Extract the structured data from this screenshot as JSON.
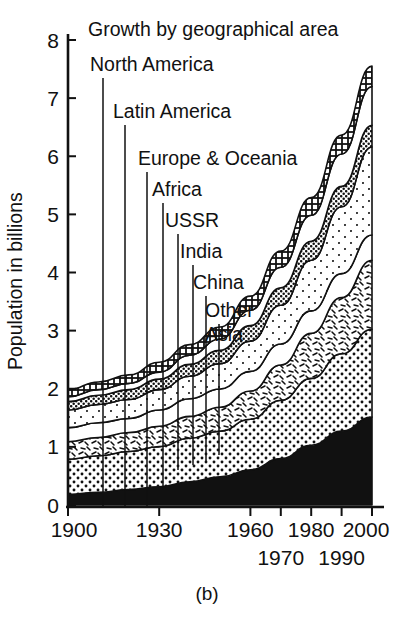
{
  "chart_data": {
    "type": "area",
    "title": "Growth by geographical area",
    "caption": "(b)",
    "xlabel": "",
    "ylabel": "Population in billions",
    "grid": false,
    "legend_position": "inline-leader-labels",
    "xlim": [
      1900,
      2000
    ],
    "ylim": [
      0,
      8
    ],
    "x": [
      1900,
      1910,
      1920,
      1930,
      1940,
      1950,
      1960,
      1970,
      1980,
      1990,
      2000
    ],
    "xticks": [
      1900,
      1930,
      1960,
      1970,
      1980,
      1990,
      2000
    ],
    "xticklabels": [
      "1900",
      "1930",
      "1960",
      "1970",
      "1980",
      "1990",
      "2000"
    ],
    "xticklabels_row1": [
      "1900",
      "1930",
      "1960",
      "1980",
      "2000"
    ],
    "xticklabels_row2": [
      "1970",
      "1990"
    ],
    "yticks": [
      0,
      1,
      2,
      3,
      4,
      5,
      6,
      7,
      8
    ],
    "yticklabels": [
      "0",
      "1",
      "2",
      "3",
      "4",
      "5",
      "6",
      "7",
      "8"
    ],
    "stack_order_bottom_to_top": [
      "China",
      "India",
      "Other Asia",
      "USSR",
      "Africa",
      "Europe & Oceania",
      "Latin America",
      "North America"
    ],
    "series": [
      {
        "name": "China",
        "pattern": "solid-black",
        "values": [
          0.15,
          0.18,
          0.22,
          0.26,
          0.33,
          0.4,
          0.5,
          0.66,
          0.85,
          1.05,
          1.25
        ]
      },
      {
        "name": "India",
        "pattern": "coarse-dots",
        "values": [
          0.5,
          0.52,
          0.54,
          0.57,
          0.62,
          0.65,
          0.72,
          0.83,
          0.95,
          1.1,
          1.25
        ]
      },
      {
        "name": "Other Asia",
        "pattern": "dashes",
        "values": [
          0.25,
          0.26,
          0.27,
          0.29,
          0.31,
          0.34,
          0.4,
          0.5,
          0.64,
          0.8,
          0.98
        ]
      },
      {
        "name": "USSR",
        "pattern": "white",
        "values": [
          0.2,
          0.21,
          0.2,
          0.23,
          0.25,
          0.26,
          0.28,
          0.3,
          0.32,
          0.34,
          0.36
        ]
      },
      {
        "name": "Africa",
        "pattern": "fine-dots",
        "values": [
          0.25,
          0.26,
          0.27,
          0.29,
          0.32,
          0.36,
          0.43,
          0.55,
          0.72,
          0.95,
          1.25
        ]
      },
      {
        "name": "Europe & Oceania",
        "pattern": "dense-black-dots",
        "values": [
          0.12,
          0.13,
          0.14,
          0.15,
          0.17,
          0.19,
          0.22,
          0.25,
          0.27,
          0.29,
          0.31
        ]
      },
      {
        "name": "Latin America",
        "pattern": "thin-white",
        "values": [
          0.07,
          0.08,
          0.09,
          0.1,
          0.13,
          0.16,
          0.22,
          0.29,
          0.37,
          0.46,
          0.55
        ]
      },
      {
        "name": "North America",
        "pattern": "checker",
        "values": [
          0.1,
          0.11,
          0.12,
          0.14,
          0.15,
          0.17,
          0.2,
          0.23,
          0.25,
          0.27,
          0.29
        ]
      }
    ],
    "totals": [
      1.64,
      1.75,
      1.85,
      2.03,
      2.28,
      2.53,
      2.97,
      3.61,
      4.37,
      5.26,
      6.24
    ],
    "peak_value": 7.55,
    "annotations": [
      {
        "label": "North America",
        "label_x": 90,
        "label_y": 71,
        "leader_x": 103,
        "leader_y0": 78,
        "leader_y1": 508
      },
      {
        "label": "Latin America",
        "label_x": 113,
        "label_y": 118,
        "leader_x": 125,
        "leader_y0": 125,
        "leader_y1": 508
      },
      {
        "label": "Europe & Oceania",
        "label_x": 138,
        "label_y": 165,
        "leader_x": 147,
        "leader_y0": 172,
        "leader_y1": 508
      },
      {
        "label": "Africa",
        "label_x": 152,
        "label_y": 196,
        "leader_x": 163,
        "leader_y0": 203,
        "leader_y1": 490
      },
      {
        "label": "USSR",
        "label_x": 165,
        "label_y": 227,
        "leader_x": 178,
        "leader_y0": 234,
        "leader_y1": 470
      },
      {
        "label": "India",
        "label_x": 180,
        "label_y": 258,
        "leader_x": 193,
        "leader_y0": 265,
        "leader_y1": 465
      },
      {
        "label": "China",
        "label_x": 193,
        "label_y": 289,
        "leader_x": 206,
        "leader_y0": 296,
        "leader_y1": 462
      },
      {
        "label": "Other",
        "label_x": 205,
        "label_y": 317,
        "leader_x": 219,
        "leader_y0": 324,
        "leader_y1": 455
      },
      {
        "label": "Asia",
        "label_x": 205,
        "label_y": 341,
        "leader_x": 219,
        "leader_y0": 324,
        "leader_y1": 455
      }
    ]
  },
  "axes": {
    "y_axis_title": "Population in billions",
    "y_tick_labels": [
      "8",
      "7",
      "6",
      "5",
      "4",
      "3",
      "2",
      "1",
      "0"
    ],
    "x_tick_labels_upper": [
      "1900",
      "1930",
      "1960",
      "1980",
      "2000"
    ],
    "x_tick_labels_lower": [
      "1970",
      "1990"
    ]
  },
  "figure": {
    "title": "Growth by geographical area",
    "caption": "(b)"
  },
  "colors": {
    "ink": "#111111",
    "paper": "#ffffff"
  }
}
